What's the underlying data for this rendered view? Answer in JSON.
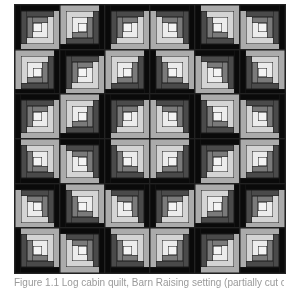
{
  "figure": {
    "type": "log cabin quilt pattern",
    "grid": {
      "rows": 6,
      "cols": 6
    },
    "blocks": [
      [
        "TL",
        "BR",
        "TL",
        "TR",
        "BL",
        "TR"
      ],
      [
        "BR",
        "TL",
        "BR",
        "BL",
        "TR",
        "BL"
      ],
      [
        "TL",
        "BR",
        "TL",
        "TR",
        "BL",
        "TR"
      ],
      [
        "BL",
        "TR",
        "BL",
        "BR",
        "TL",
        "BR"
      ],
      [
        "TR",
        "BL",
        "TR",
        "TL",
        "BR",
        "TL"
      ],
      [
        "BL",
        "TR",
        "BL",
        "BR",
        "TL",
        "BR"
      ]
    ],
    "palette": {
      "dark": [
        "#0a0a0a",
        "#4a4a4a",
        "#7a7a7a"
      ],
      "light": [
        "#ababab",
        "#d4d4d4",
        "#ececec"
      ],
      "center": "#f4f4f4",
      "line": "#1a1a1a"
    }
  },
  "caption": {
    "text": "Figure 1.1  Log cabin quilt, Barn Raising setting (partially cut off)"
  }
}
